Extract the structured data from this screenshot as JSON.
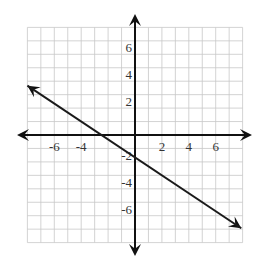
{
  "chart_data": {
    "type": "line",
    "title": "",
    "xlabel": "",
    "ylabel": "",
    "xlim": [
      -8,
      8
    ],
    "ylim": [
      -8,
      8
    ],
    "grid": true,
    "grid_step": 1,
    "x_ticks": [
      -6,
      -4,
      2,
      4,
      6
    ],
    "x_tick_labels": [
      "-6",
      "-4",
      "2",
      "4",
      "6"
    ],
    "y_ticks": [
      6,
      4,
      2,
      -2,
      -4,
      -6
    ],
    "y_tick_labels": [
      "6",
      "4",
      "2",
      "-2",
      "-4",
      "-6"
    ],
    "series": [
      {
        "name": "line",
        "equation": "y = -2/3 x - 5/3",
        "slope": -0.6667,
        "y_intercept": -1.667,
        "x_intercept": -2.5,
        "x": [
          -8,
          7.9
        ],
        "y": [
          3.67,
          -6.93
        ],
        "arrows_both_ends": true
      }
    ],
    "legend": null
  },
  "colors": {
    "grid": "#c8c8c8",
    "axis": "#111111",
    "line": "#1a1a1a",
    "label": "#333333",
    "background": "#ffffff"
  }
}
